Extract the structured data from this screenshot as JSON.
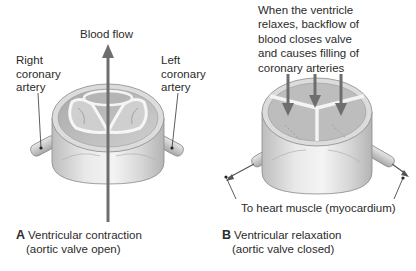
{
  "figure": {
    "panel_a": {
      "letter": "A",
      "caption_line1": "Ventricular contraction",
      "caption_line2": "(aortic valve open)",
      "labels": {
        "blood_flow": "Blood flow",
        "right_coronary": [
          "Right",
          "coronary",
          "artery"
        ],
        "left_coronary": [
          "Left",
          "coronary",
          "artery"
        ]
      }
    },
    "panel_b": {
      "letter": "B",
      "caption_line1": "Ventricular relaxation",
      "caption_line2": "(aortic valve closed)",
      "labels": {
        "backflow_note": [
          "When the ventricle",
          "relaxes, backflow of",
          "blood closes valve",
          "and causes filling of",
          "coronary arteries"
        ],
        "heart_muscle": "To heart muscle (myocardium)"
      }
    },
    "colors": {
      "arrow": "#6e6e6e",
      "valve_light": "#e4e4e4",
      "valve_mid": "#c8c8c8",
      "valve_dark": "#9a9a9a",
      "outline": "#8a8a8a",
      "text": "#2b2b2b"
    }
  }
}
